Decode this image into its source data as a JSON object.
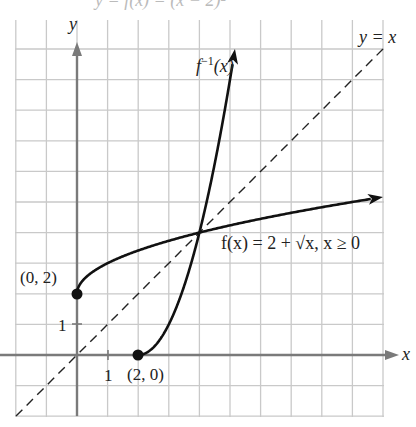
{
  "figure": {
    "top_caption_partial": "y = f(x) = (x − 2)²",
    "axes": {
      "x_label": "x",
      "y_label": "y",
      "x_tick_label": "1",
      "y_tick_label": "1"
    },
    "curves": {
      "f_label": "f(x) = 2 + √x,  x ≥ 0",
      "f_inverse_label_base": "f",
      "f_inverse_label_sup": "−1",
      "f_inverse_label_arg": "(x)",
      "identity_label": "y = x"
    },
    "points": {
      "f_start_label": "(0, 2)",
      "f_inverse_start_label": "(2, 0)"
    }
  },
  "chart_data": {
    "type": "line",
    "title": "",
    "xlabel": "x",
    "ylabel": "y",
    "xlim": [
      -2,
      10
    ],
    "ylim": [
      -2,
      10.8
    ],
    "grid": true,
    "grid_step": 1,
    "series": [
      {
        "name": "f(x) = 2 + √x, x ≥ 0",
        "style": "solid",
        "arrow_end": true,
        "x": [
          0,
          0.25,
          1,
          2,
          3,
          4,
          5,
          6,
          7,
          8,
          9,
          10
        ],
        "y": [
          2,
          2.5,
          3,
          3.41,
          3.73,
          4,
          4.24,
          4.45,
          4.65,
          4.83,
          5,
          5.16
        ]
      },
      {
        "name": "f⁻¹(x) = (x − 2)², x ≥ 2",
        "style": "solid",
        "arrow_end": true,
        "x": [
          2,
          2.5,
          3,
          3.5,
          4,
          4.5,
          5,
          5.16
        ],
        "y": [
          0,
          0.25,
          1,
          2.25,
          4,
          6.25,
          9,
          10
        ]
      },
      {
        "name": "y = x",
        "style": "dashed",
        "x": [
          -2,
          10
        ],
        "y": [
          -2,
          10
        ]
      }
    ],
    "annotations": [
      {
        "text": "(0, 2)",
        "x": 0,
        "y": 2,
        "marker": "filled-dot"
      },
      {
        "text": "(2, 0)",
        "x": 2,
        "y": 0,
        "marker": "filled-dot"
      },
      {
        "text": "f(x) = 2 + √x,  x ≥ 0",
        "x": 6.5,
        "y": 3.6
      },
      {
        "text": "f⁻¹(x)",
        "x": 3.5,
        "y": 9.2
      },
      {
        "text": "y = x",
        "x": 10,
        "y": 10.5
      }
    ]
  }
}
